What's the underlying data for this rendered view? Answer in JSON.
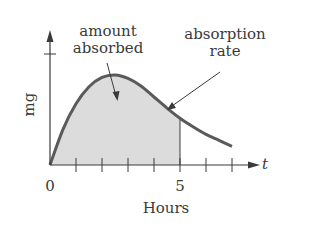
{
  "chart_data": {
    "type": "area",
    "title": "",
    "xlabel": "Hours",
    "ylabel": "mg",
    "x_axis_variable": "t",
    "xlim": [
      0,
      7.8
    ],
    "ylim": [
      0,
      1.25
    ],
    "x_ticks": [
      1,
      2,
      3,
      4,
      5,
      6,
      7
    ],
    "x_tick_labels": [
      {
        "value": 0,
        "label": "0"
      },
      {
        "value": 5,
        "label": "5"
      }
    ],
    "y_ticks": [
      1.2
    ],
    "y_tick_labels": [],
    "grid": false,
    "legend": null,
    "series": [
      {
        "name": "absorption rate",
        "style": "curve",
        "x": [
          0,
          0.5,
          1,
          1.5,
          2,
          2.5,
          3,
          3.5,
          4,
          4.5,
          5,
          5.5,
          6,
          6.5,
          7
        ],
        "values": [
          0,
          0.42,
          0.72,
          0.92,
          1.03,
          1.06,
          1.02,
          0.93,
          0.8,
          0.67,
          0.55,
          0.45,
          0.36,
          0.29,
          0.22
        ]
      }
    ],
    "shaded_region": {
      "name": "amount absorbed",
      "from_x": 0,
      "to_x": 5
    },
    "annotations": [
      {
        "text": "amount absorbed",
        "points_to": "shaded area under curve"
      },
      {
        "text": "absorption rate",
        "points_to": "curve"
      }
    ]
  },
  "labels": {
    "amount_line1": "amount",
    "amount_line2": "absorbed",
    "rate_line1": "absorption",
    "rate_line2": "rate",
    "y_axis": "mg",
    "x_axis": "Hours",
    "x_var": "t",
    "tick_0": "0",
    "tick_5": "5"
  },
  "colors": {
    "curve": "#5a5a5a",
    "shade": "#dcdcdc",
    "axis": "#3a3a3a",
    "text": "#3a3a3a"
  }
}
